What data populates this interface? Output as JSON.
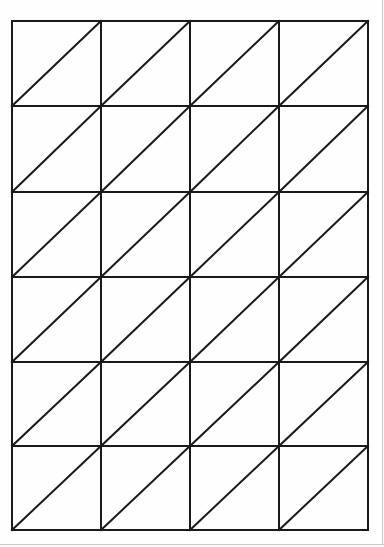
{
  "diagram": {
    "type": "lattice-grid",
    "columns": 4,
    "rows": 6,
    "diagonal_direction": "bottom-left-to-top-right",
    "grid_bounds": {
      "left": 12,
      "top": 21,
      "right": 368,
      "bottom": 530
    },
    "column_lines_x": [
      12,
      101,
      190,
      279,
      368
    ],
    "row_lines_y": [
      21,
      106,
      192,
      277,
      362,
      446,
      530
    ],
    "line_color": "#1a1a1a",
    "line_width": 2,
    "background_color": "#ffffff",
    "page_edge_color": "#c8c8c8"
  }
}
